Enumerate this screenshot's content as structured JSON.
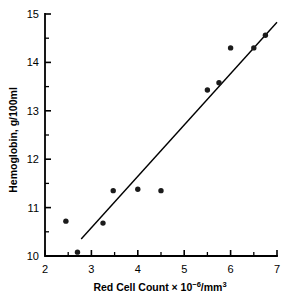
{
  "chart_data": {
    "type": "scatter",
    "title": "",
    "xlabel": "Red Cell Count × 10⁻⁶/mm³",
    "xlabel_parts": {
      "prefix": "Red Cell Count × 10",
      "exponent": "−6",
      "suffix": "/mm",
      "suffix_exponent": "3"
    },
    "ylabel": "Hemoglobin, g/100ml",
    "xlim": [
      2,
      7
    ],
    "ylim": [
      10,
      15
    ],
    "xticks": [
      2,
      3,
      4,
      5,
      6,
      7
    ],
    "xtick_labels": [
      "2",
      "3",
      "4",
      "5",
      "6",
      "7"
    ],
    "yticks": [
      10,
      11,
      12,
      13,
      14,
      15
    ],
    "ytick_labels": [
      "10",
      "11",
      "12",
      "13",
      "14",
      "15"
    ],
    "x_minor_ticks": [
      2.5,
      3.5,
      4.5,
      5.5,
      6.5
    ],
    "y_minor_ticks": [
      10.5,
      11.5,
      12.5,
      13.5,
      14.5
    ],
    "grid": false,
    "legend": null,
    "point_color": "#1b1b1b",
    "line_color": "#000000",
    "background_color": "#ffffff",
    "points": [
      {
        "x": 2.45,
        "y": 10.72
      },
      {
        "x": 2.7,
        "y": 10.08
      },
      {
        "x": 3.25,
        "y": 10.68
      },
      {
        "x": 3.47,
        "y": 11.35
      },
      {
        "x": 4.0,
        "y": 11.38
      },
      {
        "x": 4.5,
        "y": 11.35
      },
      {
        "x": 5.5,
        "y": 13.43
      },
      {
        "x": 5.75,
        "y": 13.58
      },
      {
        "x": 6.0,
        "y": 14.3
      },
      {
        "x": 6.5,
        "y": 14.3
      },
      {
        "x": 6.75,
        "y": 14.56
      }
    ],
    "fit_line": {
      "name": "regression-line",
      "x_start": 2.78,
      "y_start": 10.35,
      "x_end": 7.0,
      "y_end": 14.83
    }
  }
}
